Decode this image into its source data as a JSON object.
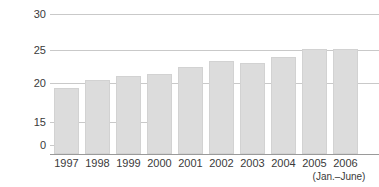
{
  "chart_data": {
    "type": "bar",
    "title": "",
    "xlabel": "",
    "ylabel": "Percent",
    "categories": [
      "1997",
      "1998",
      "1999",
      "2000",
      "2001",
      "2002",
      "2003",
      "2004",
      "2005",
      "2006"
    ],
    "values": [
      19.2,
      20.4,
      21.1,
      21.4,
      22.4,
      23.3,
      23.0,
      23.9,
      25.1,
      25.2
    ],
    "ylim": [
      0,
      30
    ],
    "yticks": [
      0,
      15,
      20,
      25,
      30
    ],
    "ytick_labels": [
      "0",
      "15",
      "20",
      "25",
      "30"
    ],
    "axis_break": true,
    "grid": true,
    "legend": false,
    "bar_color": "#dcdcdc",
    "gridline_color": "#c9c9c9",
    "annotations": [
      {
        "text": "(Jan.–June)",
        "attached_to": "2006"
      }
    ]
  },
  "axis": {
    "y_title": "Percent",
    "ticks": {
      "t30": "30",
      "t25": "25",
      "t20": "20",
      "t15": "15",
      "t0": "0"
    }
  },
  "xaxis": {
    "labels": [
      {
        "text": "1997"
      },
      {
        "text": "1998"
      },
      {
        "text": "1999"
      },
      {
        "text": "2000"
      },
      {
        "text": "2001"
      },
      {
        "text": "2002"
      },
      {
        "text": "2003"
      },
      {
        "text": "2004"
      },
      {
        "text": "2005"
      },
      {
        "text": "2006"
      }
    ],
    "sublabel": "(Jan.–June)"
  }
}
